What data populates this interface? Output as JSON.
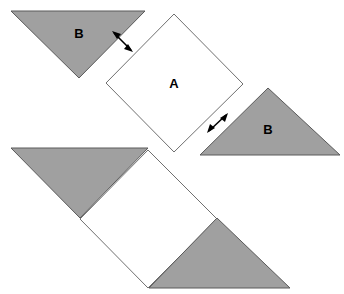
{
  "figure": {
    "canvas": {
      "width": 344,
      "height": 294,
      "background": "#ffffff"
    },
    "colors": {
      "gray_fill": "#a0a0a0",
      "gray_stroke": "#5a5a5a",
      "white_fill": "#ffffff",
      "white_stroke": "#707070",
      "arrow": "#000000",
      "label_text": "#000000"
    },
    "labels": {
      "square_a": "A",
      "triangle_b_top_left": "B",
      "triangle_b_right": "B"
    },
    "label_positions": {
      "square_a": {
        "x": 174,
        "y": 85
      },
      "triangle_b_top_left": {
        "x": 79,
        "y": 35
      },
      "triangle_b_right": {
        "x": 268,
        "y": 131
      }
    },
    "shapes": {
      "triangle_b_top_left": {
        "name": "triangle-b-top-left",
        "fill": "gray",
        "points": "11,11 145,11 79,78"
      },
      "square_a": {
        "name": "square-a",
        "fill": "white",
        "points": "174,14 243,84 174,152 106,83"
      },
      "triangle_b_right": {
        "name": "triangle-b-right",
        "fill": "gray",
        "points": "268,88 340,155 200,155"
      },
      "lower_triangle_gray_upper_left": {
        "name": "lower-triangle-gray-upper-left",
        "fill": "gray",
        "points": "11,148 148,148 80,218"
      },
      "lower_square_white": {
        "name": "lower-square-white",
        "fill": "white",
        "points": "148,150 217,219 148,288 80,219"
      },
      "lower_triangle_gray_lower_right": {
        "name": "lower-triangle-gray-lower-right",
        "fill": "gray",
        "points": "217,218 290,288 149,288"
      }
    },
    "arrows": [
      {
        "name": "gap-arrow-top-left",
        "description": "double-headed arrow marking gap between top-left triangle hypotenuse and square A upper-left edge",
        "x1": 114,
        "y1": 33,
        "x2": 131,
        "y2": 50
      },
      {
        "name": "gap-arrow-right",
        "description": "double-headed arrow marking gap between square A lower-right edge and right triangle",
        "x1": 209,
        "y1": 131,
        "x2": 226,
        "y2": 115
      }
    ]
  }
}
